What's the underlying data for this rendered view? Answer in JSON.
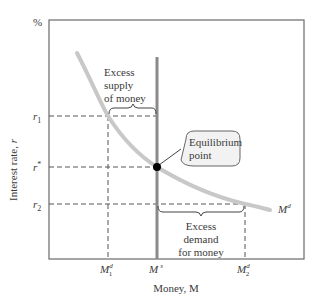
{
  "diagram": {
    "type": "money-market-equilibrium",
    "y_axis": {
      "unit_label": "%",
      "title": "Interest rate, r",
      "ticks": {
        "r1": {
          "main": "r",
          "sub": "1"
        },
        "rstar": {
          "main": "r",
          "sup": "*"
        },
        "r2": {
          "main": "r",
          "sub": "2"
        }
      }
    },
    "x_axis": {
      "title": "Money, M",
      "ticks": {
        "m1d": {
          "main": "M",
          "sup": "d",
          "sub": "1"
        },
        "ms": {
          "main": "M",
          "sup": "s"
        },
        "m2d": {
          "main": "M",
          "sup": "d",
          "sub": "2"
        }
      }
    },
    "curves": {
      "demand": {
        "main": "M",
        "sup": "d",
        "color": "#c8c8c8"
      },
      "supply": {
        "color": "#8a8a8a"
      }
    },
    "annotations": {
      "excess_supply": [
        "Excess",
        "supply",
        "of money"
      ],
      "excess_demand": [
        "Excess",
        "demand",
        "for money"
      ],
      "equilibrium": [
        "Equilibrium",
        "point"
      ]
    },
    "colors": {
      "frame": "#6a6a6a",
      "dashed": "#555555",
      "point": "#000000",
      "callout_fill": "#f2f2f2"
    }
  }
}
